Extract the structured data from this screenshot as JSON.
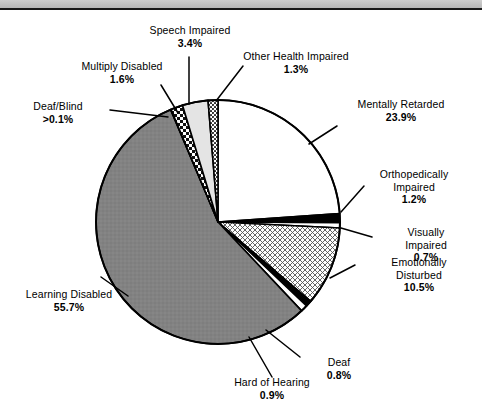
{
  "page": {
    "background_color": "#ffffff",
    "header_band_color": "#c2c2c2",
    "rule_color": "#1a1a1a"
  },
  "chart_data": {
    "type": "pie",
    "title": "",
    "subtitle": "",
    "xlabel": "",
    "ylabel": "",
    "units": "percent",
    "legend_position": "none",
    "labels_inline": true,
    "start_angle_deg": 0,
    "direction": "clockwise",
    "total": 100.0,
    "categories": [
      "Mentally Retarded",
      "Orthopedically Impaired",
      "Visually Impaired",
      "Emotionally Disturbed",
      "Deaf",
      "Hard of Hearing",
      "Learning Disabled",
      "Deaf/Blind",
      "Multiply Disabled",
      "Speech Impaired",
      "Other Health Impaired"
    ],
    "values": [
      23.9,
      1.2,
      0.7,
      10.5,
      0.8,
      0.9,
      55.7,
      0.05,
      1.6,
      3.4,
      1.3
    ],
    "value_labels": [
      "23.9%",
      "1.2%",
      "0.7%",
      "10.5%",
      "0.8%",
      "0.9%",
      "55.7%",
      ">0.1%",
      "1.6%",
      "3.4%",
      "1.3%"
    ],
    "slices": [
      {
        "name": "Mentally Retarded",
        "value": 23.9,
        "value_label": "23.9%",
        "fill": "white",
        "fill_color": "#ffffff"
      },
      {
        "name": "Orthopedically Impaired",
        "value": 1.2,
        "value_label": "1.2%",
        "fill": "solid-black",
        "fill_color": "#000000"
      },
      {
        "name": "Visually Impaired",
        "value": 0.7,
        "value_label": "0.7%",
        "fill": "white",
        "fill_color": "#ffffff"
      },
      {
        "name": "Emotionally Disturbed",
        "value": 10.5,
        "value_label": "10.5%",
        "fill": "crosshatch",
        "fill_color": "#ffffff"
      },
      {
        "name": "Deaf",
        "value": 0.8,
        "value_label": "0.8%",
        "fill": "solid-black",
        "fill_color": "#000000"
      },
      {
        "name": "Hard of Hearing",
        "value": 0.9,
        "value_label": "0.9%",
        "fill": "white",
        "fill_color": "#ffffff"
      },
      {
        "name": "Learning Disabled",
        "value": 55.7,
        "value_label": "55.7%",
        "fill": "solid-gray",
        "fill_color": "#808080"
      },
      {
        "name": "Deaf/Blind",
        "value": 0.05,
        "value_label": ">0.1%",
        "fill": "solid-black",
        "fill_color": "#000000"
      },
      {
        "name": "Multiply Disabled",
        "value": 1.6,
        "value_label": "1.6%",
        "fill": "checker",
        "fill_color": "#ffffff"
      },
      {
        "name": "Speech Impaired",
        "value": 3.4,
        "value_label": "3.4%",
        "fill": "light-gray",
        "fill_color": "#e2e2e2"
      },
      {
        "name": "Other Health Impaired",
        "value": 1.3,
        "value_label": "1.3%",
        "fill": "dotted",
        "fill_color": "#ffffff"
      }
    ]
  },
  "labels": {
    "speech_impaired": {
      "name": "Speech Impaired",
      "pct": "3.4%"
    },
    "other_health_impaired": {
      "name": "Other Health Impaired",
      "pct": "1.3%"
    },
    "multiply_disabled": {
      "name": "Multiply Disabled",
      "pct": "1.6%"
    },
    "deaf_blind": {
      "name": "Deaf/Blind",
      "pct": ">0.1%"
    },
    "mentally_retarded": {
      "name": "Mentally Retarded",
      "pct": "23.9%"
    },
    "orthopedically_impaired": {
      "name": "Orthopedically",
      "name2": "Impaired",
      "pct": "1.2%"
    },
    "visually_impaired": {
      "name": "Visually",
      "name2": "Impaired",
      "pct": "0.7%"
    },
    "emotionally_disturbed": {
      "name": "Emotionally",
      "name2": "Disturbed",
      "pct": "10.5%"
    },
    "deaf": {
      "name": "Deaf",
      "pct": "0.8%"
    },
    "hard_of_hearing": {
      "name": "Hard of Hearing",
      "pct": "0.9%"
    },
    "learning_disabled": {
      "name": "Learning Disabled",
      "pct": "55.7%"
    }
  }
}
